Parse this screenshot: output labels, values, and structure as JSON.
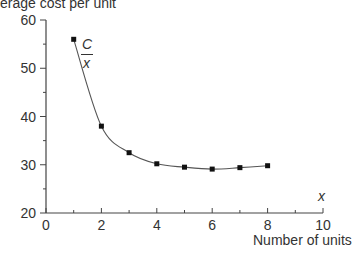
{
  "chart_data": {
    "type": "line",
    "title": "",
    "ylabel": "Average cost per unit",
    "xlabel": "Number of units",
    "x_axis_var": "x",
    "curve_label": {
      "numerator": "C",
      "denominator": "x"
    },
    "xlim": [
      0,
      10
    ],
    "ylim": [
      20,
      60
    ],
    "x_ticks": [
      0,
      2,
      4,
      6,
      8,
      10
    ],
    "y_ticks": [
      20,
      30,
      40,
      50,
      60
    ],
    "grid": false,
    "legend": "none",
    "series": [
      {
        "name": "C/x",
        "x": [
          1,
          2,
          3,
          4,
          5,
          6,
          7,
          8
        ],
        "values": [
          56,
          38,
          32.5,
          30.2,
          29.5,
          29.1,
          29.4,
          29.8
        ],
        "markers": "square"
      }
    ]
  },
  "labels": {
    "ylabel": "erage cost per unit",
    "xlabel": "Number of units",
    "xvar": "x",
    "curve_num": "C",
    "curve_den": "x"
  }
}
